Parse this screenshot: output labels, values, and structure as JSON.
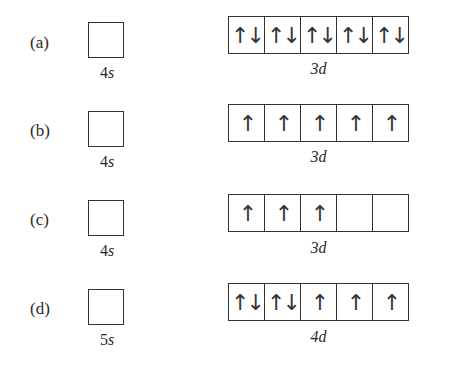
{
  "options": [
    {
      "label": "(a)",
      "s_orbital": {
        "num": "4",
        "sub": "s",
        "electrons": ""
      },
      "d_orbital": {
        "num": "3",
        "sub": "d",
        "cells": [
          "↑↓",
          "↑↓",
          "↑↓",
          "↑↓",
          "↑↓"
        ]
      }
    },
    {
      "label": "(b)",
      "s_orbital": {
        "num": "4",
        "sub": "s",
        "electrons": ""
      },
      "d_orbital": {
        "num": "3",
        "sub": "d",
        "cells": [
          "↑",
          "↑",
          "↑",
          "↑",
          "↑"
        ]
      }
    },
    {
      "label": "(c)",
      "s_orbital": {
        "num": "4",
        "sub": "s",
        "electrons": ""
      },
      "d_orbital": {
        "num": "3",
        "sub": "d",
        "cells": [
          "↑",
          "↑",
          "↑",
          "",
          ""
        ]
      }
    },
    {
      "label": "(d)",
      "s_orbital": {
        "num": "5",
        "sub": "s",
        "electrons": ""
      },
      "d_orbital": {
        "num": "4",
        "sub": "d",
        "cells": [
          "↑↓",
          "↑↓",
          "↑",
          "↑",
          "↑"
        ]
      }
    }
  ]
}
